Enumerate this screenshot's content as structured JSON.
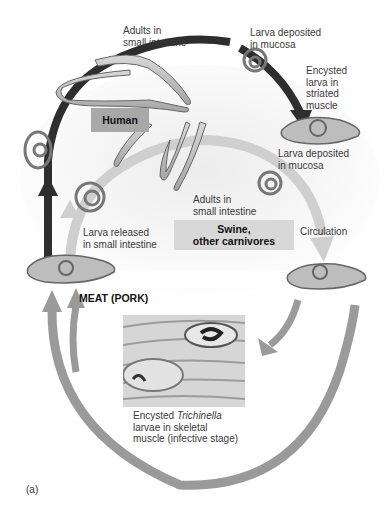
{
  "figure": {
    "panel_label": "(a)"
  },
  "hosts": {
    "human": "Human",
    "swine_line1": "Swine,",
    "swine_line2": "other carnivores"
  },
  "labels": {
    "adults_human_l1": "Adults in",
    "adults_human_l2": "small intestine",
    "larva_deposited_top_l1": "Larva deposited",
    "larva_deposited_top_l2": "in mucosa",
    "encysted_l1": "Encysted",
    "encysted_l2": "larva in",
    "encysted_l3": "striated",
    "encysted_l4": "muscle",
    "larva_deposited_mid_l1": "Larva deposited",
    "larva_deposited_mid_l2": "in mucosa",
    "adults_swine_l1": "Adults in",
    "adults_swine_l2": "small intestine",
    "larva_released_l1": "Larva released",
    "larva_released_l2": "in small intestine",
    "circulation": "Circulation",
    "meat": "MEAT (PORK)",
    "photo_caption_l1_pre": "Encysted ",
    "photo_caption_l1_italic": "Trichinella",
    "photo_caption_l2": "larvae in skeletal",
    "photo_caption_l3": "muscle (infective stage)"
  },
  "colors": {
    "human_arrow": "#2e2e2e",
    "swine_arrow": "#c8c8c8",
    "outer_arrow": "#9a9a9a",
    "human_box": "#a8a8a8",
    "swine_box": "#d8d8d8"
  }
}
